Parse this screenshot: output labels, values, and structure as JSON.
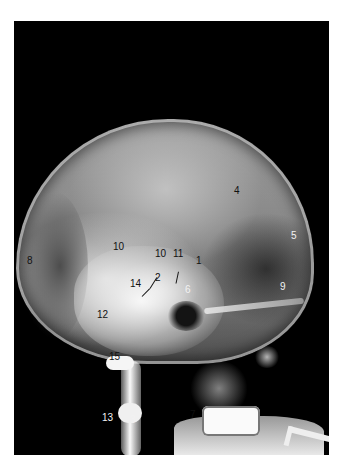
{
  "figure": {
    "type": "lateral skull radiograph (angiogram)",
    "labels": [
      {
        "id": "l4",
        "text": "4",
        "x": 234,
        "y": 196,
        "tone": "dark"
      },
      {
        "id": "l5",
        "text": "5",
        "x": 291,
        "y": 241,
        "tone": "light"
      },
      {
        "id": "l8",
        "text": "8",
        "x": 27,
        "y": 266,
        "tone": "dark"
      },
      {
        "id": "l10a",
        "text": "10",
        "x": 113,
        "y": 252,
        "tone": "dark"
      },
      {
        "id": "l10b",
        "text": "10",
        "x": 155,
        "y": 259,
        "tone": "dark"
      },
      {
        "id": "l11",
        "text": "11",
        "x": 173,
        "y": 259,
        "tone": "dark"
      },
      {
        "id": "l1",
        "text": "1",
        "x": 196,
        "y": 266,
        "tone": "dark"
      },
      {
        "id": "l14",
        "text": "14",
        "x": 130,
        "y": 289,
        "tone": "dark"
      },
      {
        "id": "l2",
        "text": "2",
        "x": 155,
        "y": 283,
        "tone": "dark"
      },
      {
        "id": "l6",
        "text": "6",
        "x": 185,
        "y": 295,
        "tone": "light"
      },
      {
        "id": "l9",
        "text": "9",
        "x": 280,
        "y": 292,
        "tone": "light"
      },
      {
        "id": "l12",
        "text": "12",
        "x": 97,
        "y": 320,
        "tone": "dark"
      },
      {
        "id": "l15",
        "text": "15",
        "x": 109,
        "y": 362,
        "tone": "dark"
      },
      {
        "id": "l13",
        "text": "13",
        "x": 102,
        "y": 423,
        "tone": "light"
      },
      {
        "id": "l3",
        "text": "3",
        "x": 130,
        "y": 425,
        "tone": "light"
      },
      {
        "id": "l7",
        "text": "7",
        "x": 190,
        "y": 420,
        "tone": "dark"
      }
    ],
    "leaders": [
      {
        "id": "ld10b",
        "x": 150,
        "y": 288,
        "len": 13,
        "angle": -58
      },
      {
        "id": "ld14",
        "x": 142,
        "y": 296,
        "len": 11,
        "angle": -45
      },
      {
        "id": "ld11",
        "x": 176,
        "y": 283,
        "len": 12,
        "angle": -78
      }
    ]
  }
}
